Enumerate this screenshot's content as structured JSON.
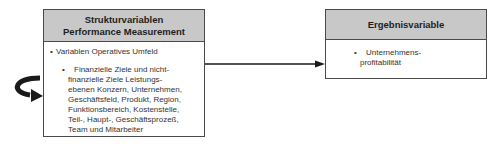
{
  "diagram": {
    "left_box": {
      "title_line1": "Strukturvariablen",
      "title_line2": "Performance Measurement",
      "items": [
        {
          "bullet": "•",
          "text": "Variablen Operatives Umfeld",
          "subitems": [
            {
              "bullet": "•",
              "lines": [
                "Finanzielle Ziele und nicht-",
                "finanzielle Ziele Leistungs-",
                "ebenen Konzern, Unternehmen,",
                "Geschäftsfeld, Produkt, Region,",
                "Funktionsbereich, Kostenstelle,",
                "Teil-, Haupt-, Geschäftsprozeß,",
                "Team und Mitarbeiter"
              ]
            }
          ]
        }
      ]
    },
    "right_box": {
      "title": "Ergebnisvariable",
      "items": [
        {
          "bullet": "•",
          "lines": [
            "Unternehmens-",
            "profitabilität"
          ]
        }
      ]
    },
    "connectors": [
      {
        "type": "arrow",
        "from": "left_box",
        "to": "right_box"
      },
      {
        "type": "loop-arrow",
        "target": "left_box"
      }
    ],
    "colors": {
      "header_fill": "#c8c8c8",
      "border": "#4a4a4a",
      "arrow": "#1a1a1a"
    }
  }
}
